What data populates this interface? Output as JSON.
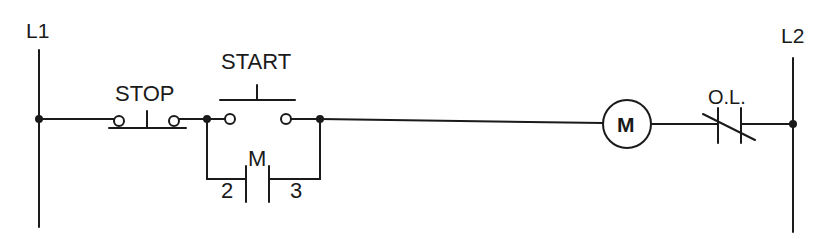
{
  "diagram": {
    "type": "ladder-logic",
    "rails": {
      "left": {
        "label": "L1"
      },
      "right": {
        "label": "L2"
      }
    },
    "components": {
      "stop": {
        "label": "STOP",
        "kind": "normally-closed pushbutton"
      },
      "start": {
        "label": "START",
        "kind": "normally-open pushbutton"
      },
      "seal_in": {
        "label": "M",
        "kind": "normally-open contact",
        "terminal_left": "2",
        "terminal_right": "3"
      },
      "motor": {
        "label": "M",
        "kind": "motor starter coil"
      },
      "overload": {
        "label": "O.L.",
        "kind": "normally-closed overload contact"
      }
    },
    "colors": {
      "line": "#1a1a1a",
      "background": "#ffffff"
    }
  }
}
